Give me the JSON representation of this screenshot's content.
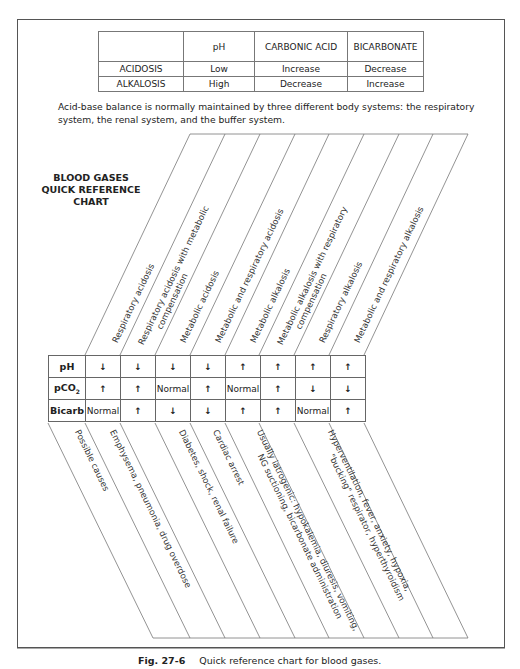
{
  "summary_table": {
    "headers": [
      "",
      "pH",
      "CARBONIC ACID",
      "BICARBONATE"
    ],
    "rows": [
      {
        "label": "ACIDOSIS",
        "ph": "Low",
        "carbonic_acid": "Increase",
        "bicarbonate": "Decrease"
      },
      {
        "label": "ALKALOSIS",
        "ph": "High",
        "carbonic_acid": "Decrease",
        "bicarbonate": "Increase"
      }
    ]
  },
  "intro_text": "Acid-base balance is normally maintained by three different body systems: the respiratory system, the renal system, and the buffer system.",
  "chart_title": {
    "line1": "BLOOD GASES",
    "line2": "QUICK REFERENCE",
    "line3": "CHART"
  },
  "columns": [
    {
      "name": "Respiratory acidosis",
      "ph": "down",
      "pco2": "up",
      "bicarb": "Normal"
    },
    {
      "name": "Respiratory acidosis with metabolic compensation",
      "line1": "Respiratory acidosis with metabolic",
      "line2": "compensation",
      "ph": "down",
      "pco2": "up",
      "bicarb": "up"
    },
    {
      "name": "Metabolic acidosis",
      "ph": "down",
      "pco2": "Normal",
      "bicarb": "down"
    },
    {
      "name": "Metabolic and respiratory acidosis",
      "ph": "down",
      "pco2": "up",
      "bicarb": "down"
    },
    {
      "name": "Metabolic alkalosis",
      "ph": "up",
      "pco2": "Normal",
      "bicarb": "up"
    },
    {
      "name": "Metabolic alkalosis with respiratory compensation",
      "line1": "Metabolic alkalosis with respiratory",
      "line2": "compensation",
      "ph": "up",
      "pco2": "up",
      "bicarb": "up"
    },
    {
      "name": "Respiratory alkalosis",
      "ph": "up",
      "pco2": "down",
      "bicarb": "Normal"
    },
    {
      "name": "Metabolic and respiratory alkalosis",
      "ph": "up",
      "pco2": "down",
      "bicarb": "up"
    }
  ],
  "row_labels": {
    "ph": "pH",
    "pco2": "pCO",
    "pco2_sub": "2",
    "bicarb": "Bicarb"
  },
  "symbols": {
    "up": "↑",
    "down": "↓",
    "normal": "Normal"
  },
  "grid": {
    "ph": [
      "↓",
      "↓",
      "↓",
      "↓",
      "↑",
      "↑",
      "↑",
      "↑"
    ],
    "pco2": [
      "↑",
      "↑",
      "Normal",
      "↑",
      "Normal",
      "↑",
      "↓",
      "↓"
    ],
    "bicarb": [
      "Normal",
      "↑",
      "↓",
      "↓",
      "↑",
      "↑",
      "Normal",
      "↑"
    ]
  },
  "causes": {
    "label": "Possible causes",
    "respiratory_acidosis": "Emphysema, pneumonia, drug overdose",
    "metabolic_acidosis": "Diabetes, shock, renal failure",
    "mixed_acidosis": "Cardiac arrest",
    "metabolic_alkalosis_line1": "Usually iatrogenic: hypokalemia, diuresis, vomiting,",
    "metabolic_alkalosis_line2": "NG suctioning, bicarbonate administration",
    "respiratory_alkalosis_line1": "Hyperventilation, fever, anxiety, hypoxia,",
    "respiratory_alkalosis_line2": "\"bucking\" respirator, hyperthyroidism"
  },
  "caption": {
    "fig": "Fig. 27-6",
    "text": "Quick reference chart for blood gases."
  }
}
